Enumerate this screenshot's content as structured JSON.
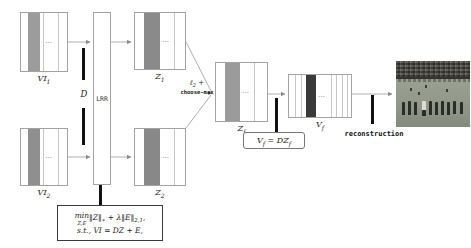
{
  "colors": {
    "vi1_stripe": "#9c9c9c",
    "vi2_stripe": "#8f8f8f",
    "z1_stripe": "#8a8a8a",
    "z2_stripe": "#888888",
    "zf_stripe": "#9b9b9b",
    "vf_stripe": "#3a3a3a",
    "bar": "#111111",
    "line": "#9a9a9a"
  },
  "matrices": {
    "vi1": {
      "base": "VI",
      "sub": "1"
    },
    "vi2": {
      "base": "VI",
      "sub": "2"
    },
    "z1": {
      "base": "Z",
      "sub": "1"
    },
    "z2": {
      "base": "Z",
      "sub": "2"
    },
    "zf": {
      "base": "Z",
      "sub": "f"
    },
    "vf": {
      "base": "V",
      "sub": "f"
    }
  },
  "lrr": {
    "label": "LRR"
  },
  "dictionary": {
    "label": "D"
  },
  "fusion": {
    "line1_base": "ℓ",
    "line1_sub": "2",
    "line1_op": " +",
    "line2": "choose-max"
  },
  "formula": {
    "min": "min",
    "min_sub": "Z,E",
    "norm_z": "‖Z‖",
    "norm_z_sub": "∗",
    "plus_term": " + λ‖E‖",
    "plus_sub": "2,1",
    "tail": ",",
    "line2": "s.t., VI = DZ + E,"
  },
  "equation": {
    "v": "V",
    "v_sub": "f",
    "mid": " = DZ",
    "mid_sub": "f"
  },
  "reconstruction": {
    "label": "reconstruction"
  },
  "glyphs": {
    "dots": "…"
  }
}
